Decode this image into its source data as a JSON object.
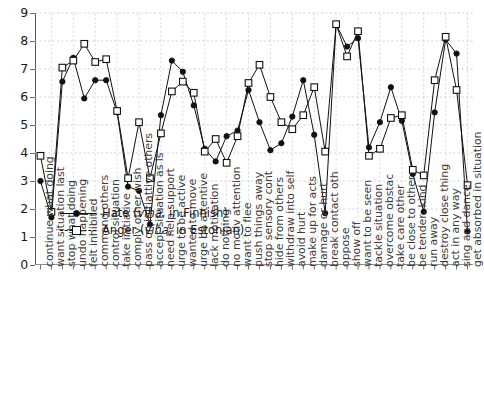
{
  "chart_data": {
    "type": "line",
    "title": "",
    "xlabel": "",
    "ylabel": "",
    "ylim": [
      0,
      9
    ],
    "yticks": [
      0,
      1,
      2,
      3,
      4,
      5,
      6,
      7,
      8,
      9
    ],
    "grid": true,
    "legend_position": "lower-left inside axes",
    "categories": [
      "continue what doing",
      "want situation last",
      "stop what doing",
      "undo happening",
      "felt inhibited",
      "command others",
      "control situation",
      "take initiative",
      "comply other wish",
      "pass on initiattive others",
      "accept situation as is",
      "need help support",
      "urge to be active",
      "wanted to move",
      "urge be attentive",
      "lack motivation",
      "do nothing",
      "no motiv attention",
      "want to flee",
      "push things away",
      "stop sensory cont",
      "hide from others",
      "withdraw into self",
      "avoid hurt",
      "make up for acts",
      "damage or hurt",
      "break contact oth",
      "oppose",
      "show off",
      "want to be seen",
      "tackle situation",
      "overcome obstac",
      "take care other",
      "be close to other",
      "be tender, kind",
      "run away",
      "destroy close thing",
      "act in any way",
      "sing and dance",
      "get absorbed in situation"
    ],
    "series": [
      {
        "name": "Hate (viha, in Finnish)",
        "marker": "filled-circle",
        "linestyle": "solid",
        "color": "#111111",
        "values": [
          3.0,
          1.7,
          6.55,
          7.4,
          5.95,
          6.6,
          6.6,
          5.45,
          2.8,
          2.65,
          1.45,
          5.35,
          7.3,
          6.9,
          5.7,
          4.15,
          3.7,
          4.6,
          4.8,
          6.25,
          5.1,
          4.1,
          4.35,
          5.3,
          6.6,
          4.65,
          1.85,
          8.6,
          7.8,
          8.1,
          4.2,
          5.1,
          6.35,
          5.15,
          3.25,
          1.9,
          5.45,
          8.05,
          7.55,
          1.2
        ]
      },
      {
        "name": "Anger (viha, in Estonian)",
        "marker": "open-square",
        "linestyle": "dashed",
        "color": "#111111",
        "values": [
          3.9,
          1.9,
          7.05,
          7.3,
          7.9,
          7.25,
          7.35,
          5.5,
          3.1,
          5.1,
          3.1,
          4.7,
          6.2,
          6.55,
          6.15,
          4.05,
          4.5,
          3.65,
          4.6,
          6.5,
          7.15,
          6.0,
          5.1,
          4.85,
          5.35,
          6.35,
          4.05,
          8.6,
          7.45,
          8.35,
          3.9,
          4.15,
          5.25,
          5.35,
          3.4,
          3.2,
          6.6,
          8.15,
          6.25,
          2.85
        ]
      }
    ]
  },
  "legend": {
    "items": [
      {
        "label_prefix": "Hate (",
        "label_italic": "viha",
        "label_suffix": ", in Finnish)"
      },
      {
        "label_prefix": "Anger (",
        "label_italic": "viha",
        "label_suffix": ", in Estonian)"
      }
    ]
  }
}
